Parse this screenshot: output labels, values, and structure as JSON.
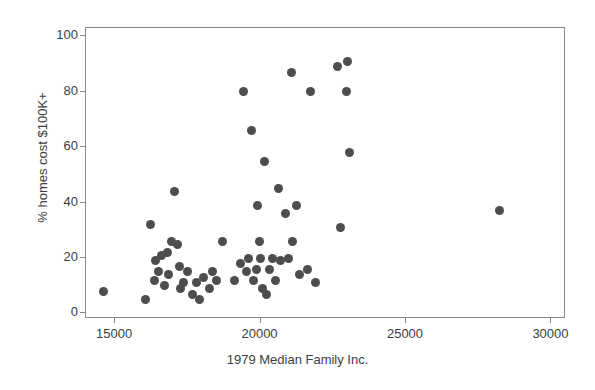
{
  "chart_data": {
    "type": "scatter",
    "title": "",
    "xlabel": "1979 Median Family Inc.",
    "ylabel": "% homes cost $100K+",
    "xlim": [
      14000,
      30500
    ],
    "ylim": [
      -2,
      103
    ],
    "xticks": [
      15000,
      20000,
      25000,
      30000
    ],
    "xtick_labels": [
      "15000",
      "20000",
      "25000",
      "30000"
    ],
    "yticks": [
      0,
      20,
      40,
      60,
      80,
      100
    ],
    "ytick_labels": [
      "0",
      "20",
      "40",
      "60",
      "80",
      "100"
    ],
    "grid": false,
    "legend": "none",
    "marker_color": "#4d4d4d",
    "marker_size_px": 9,
    "frame_color": "#8a8a8a",
    "points": [
      {
        "x": 14600,
        "y": 8
      },
      {
        "x": 16050,
        "y": 5
      },
      {
        "x": 16200,
        "y": 32
      },
      {
        "x": 16350,
        "y": 12
      },
      {
        "x": 16400,
        "y": 19
      },
      {
        "x": 16500,
        "y": 15
      },
      {
        "x": 16600,
        "y": 21
      },
      {
        "x": 16700,
        "y": 10
      },
      {
        "x": 16800,
        "y": 22
      },
      {
        "x": 16850,
        "y": 14
      },
      {
        "x": 16950,
        "y": 26
      },
      {
        "x": 17050,
        "y": 44
      },
      {
        "x": 17150,
        "y": 25
      },
      {
        "x": 17200,
        "y": 17
      },
      {
        "x": 17250,
        "y": 9
      },
      {
        "x": 17350,
        "y": 11
      },
      {
        "x": 17500,
        "y": 15
      },
      {
        "x": 17650,
        "y": 7
      },
      {
        "x": 17800,
        "y": 11
      },
      {
        "x": 17900,
        "y": 5
      },
      {
        "x": 18050,
        "y": 13
      },
      {
        "x": 18250,
        "y": 9
      },
      {
        "x": 18350,
        "y": 15
      },
      {
        "x": 18500,
        "y": 12
      },
      {
        "x": 18700,
        "y": 26
      },
      {
        "x": 19100,
        "y": 12
      },
      {
        "x": 19300,
        "y": 18
      },
      {
        "x": 19400,
        "y": 80
      },
      {
        "x": 19500,
        "y": 15
      },
      {
        "x": 19600,
        "y": 20
      },
      {
        "x": 19700,
        "y": 66
      },
      {
        "x": 19750,
        "y": 12
      },
      {
        "x": 19850,
        "y": 16
      },
      {
        "x": 19900,
        "y": 39
      },
      {
        "x": 19950,
        "y": 26
      },
      {
        "x": 20000,
        "y": 20
      },
      {
        "x": 20050,
        "y": 9
      },
      {
        "x": 20150,
        "y": 55
      },
      {
        "x": 20200,
        "y": 7
      },
      {
        "x": 20300,
        "y": 16
      },
      {
        "x": 20400,
        "y": 20
      },
      {
        "x": 20500,
        "y": 12
      },
      {
        "x": 20600,
        "y": 45
      },
      {
        "x": 20700,
        "y": 19
      },
      {
        "x": 20850,
        "y": 36
      },
      {
        "x": 20950,
        "y": 20
      },
      {
        "x": 21050,
        "y": 87
      },
      {
        "x": 21100,
        "y": 26
      },
      {
        "x": 21250,
        "y": 39
      },
      {
        "x": 21350,
        "y": 14
      },
      {
        "x": 21600,
        "y": 16
      },
      {
        "x": 21700,
        "y": 80
      },
      {
        "x": 21900,
        "y": 11
      },
      {
        "x": 22650,
        "y": 89
      },
      {
        "x": 22750,
        "y": 31
      },
      {
        "x": 22950,
        "y": 80
      },
      {
        "x": 23000,
        "y": 91
      },
      {
        "x": 23050,
        "y": 58
      },
      {
        "x": 28200,
        "y": 37
      }
    ]
  }
}
